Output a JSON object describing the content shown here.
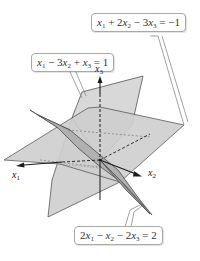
{
  "figure": {
    "equations": [
      {
        "id": "plane1",
        "var": [
          "x",
          "1",
          " + 2",
          "x",
          "2",
          " − 3",
          "x",
          "3",
          " = −1"
        ],
        "text": "x1 + 2x2 − 3x3 = −1"
      },
      {
        "id": "plane2",
        "var": [
          "x",
          "1",
          " − 3",
          "x",
          "2",
          " + ",
          "x",
          "3",
          " = 1"
        ],
        "text": "x1 − 3x2 + x3 = 1"
      },
      {
        "id": "plane3",
        "var": [
          "2",
          "x",
          "1",
          " − ",
          "x",
          "2",
          " − 2",
          "x",
          "3",
          " = 2"
        ],
        "text": "2x1 − x2 − 2x3 = 2"
      }
    ],
    "axes": {
      "x1": {
        "base": "x",
        "sub": "1"
      },
      "x2": {
        "base": "x",
        "sub": "2"
      },
      "x3": {
        "base": "x",
        "sub": "3"
      }
    },
    "colors": {
      "plane_light": "#d9d9d9",
      "plane_mid": "#c8c8c8",
      "plane_dark": "#a9a9a9",
      "edge": "#4a4a4a",
      "axis": "#1a1a1a",
      "callout_border": "#a8a8a8"
    }
  }
}
